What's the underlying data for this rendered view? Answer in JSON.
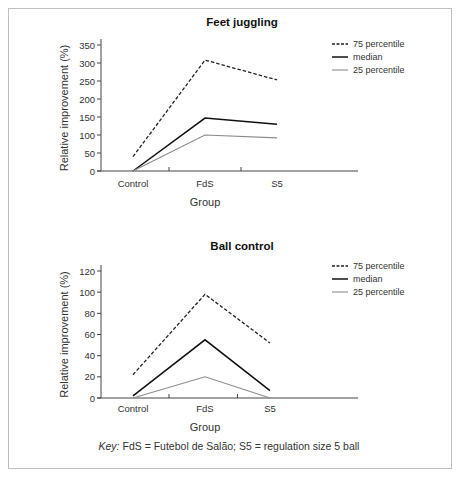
{
  "key": {
    "prefix": "Key:",
    "text": " FdS = Futebol de Salão; S5 = regulation size 5 ball"
  },
  "chart_data": [
    {
      "type": "line",
      "title": "Feet juggling",
      "xlabel": "Group",
      "ylabel": "Relative improvement (%)",
      "categories": [
        "Control",
        "FdS",
        "S5"
      ],
      "ylim": [
        0,
        350
      ],
      "yticks": [
        0,
        50,
        100,
        150,
        200,
        250,
        300,
        350
      ],
      "grid": false,
      "legend_position": "top-right",
      "series": [
        {
          "name": "75 percentile",
          "style": "dashed",
          "color": "#222222",
          "values": [
            40,
            308,
            253
          ]
        },
        {
          "name": "median",
          "style": "solid",
          "color": "#111111",
          "values": [
            0,
            147,
            130
          ]
        },
        {
          "name": "25 percentile",
          "style": "solid",
          "color": "#8c8c8c",
          "values": [
            0,
            100,
            92
          ]
        }
      ]
    },
    {
      "type": "line",
      "title": "Ball control",
      "xlabel": "Group",
      "ylabel": "Relative improvement (%)",
      "categories": [
        "Control",
        "FdS",
        "S5"
      ],
      "ylim": [
        0,
        120
      ],
      "yticks": [
        0,
        20,
        40,
        60,
        80,
        100,
        120
      ],
      "grid": false,
      "legend_position": "top-right",
      "series": [
        {
          "name": "75 percentile",
          "style": "dashed",
          "color": "#222222",
          "values": [
            22,
            98,
            52
          ]
        },
        {
          "name": "median",
          "style": "solid",
          "color": "#111111",
          "values": [
            2,
            55,
            7
          ]
        },
        {
          "name": "25 percentile",
          "style": "solid",
          "color": "#8c8c8c",
          "values": [
            0,
            20,
            0
          ]
        }
      ]
    }
  ]
}
